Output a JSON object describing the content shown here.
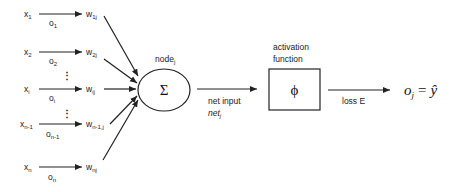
{
  "diagram": {
    "type": "neural-network-node",
    "inputs": [
      {
        "x": "x",
        "x_sub": "1",
        "o": "o",
        "o_sub": "1",
        "w": "w",
        "w_sub": "1j"
      },
      {
        "x": "x",
        "x_sub": "2",
        "o": "o",
        "o_sub": "2",
        "w": "w",
        "w_sub": "2j"
      },
      {
        "x": "x",
        "x_sub": "i",
        "o": "o",
        "o_sub": "i",
        "w": "w",
        "w_sub": "ij"
      },
      {
        "x": "x",
        "x_sub": "n-1",
        "o": "o",
        "o_sub": "n-1",
        "w": "w",
        "w_sub": "n-1,j"
      },
      {
        "x": "x",
        "x_sub": "n",
        "o": "o",
        "o_sub": "n",
        "w": "w",
        "w_sub": "nj"
      }
    ],
    "ellipsis": "⋮",
    "node": {
      "label": "node",
      "label_sub": "j",
      "symbol": "Σ"
    },
    "net_input": {
      "label": "net input",
      "var": "net",
      "var_sub": "j"
    },
    "activation": {
      "label_line1": "activation",
      "label_line2": "function",
      "symbol": "ϕ"
    },
    "loss": {
      "label": "loss E"
    },
    "output": {
      "lhs": "o",
      "lhs_sub": "j",
      "eq": "=",
      "rhs": "ŷ"
    }
  }
}
